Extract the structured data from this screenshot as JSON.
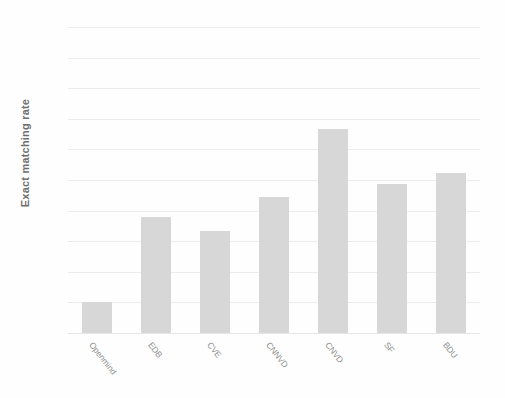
{
  "chart_data": {
    "type": "bar",
    "title": "",
    "subtitle": "",
    "xlabel": "",
    "ylabel": "Exact matching rate",
    "categories": [
      "Openmind",
      "EDB",
      "CVE",
      "CNNVD",
      "CNVD",
      "SF",
      "BDU"
    ],
    "values": [
      0.05,
      0.19,
      0.167,
      0.222,
      0.333,
      0.244,
      0.261
    ],
    "series": [
      {
        "name": "Exact matching rate",
        "values": [
          0.05,
          0.19,
          0.167,
          0.222,
          0.333,
          0.244,
          0.261
        ]
      }
    ],
    "ylim": [
      0,
      0.5
    ],
    "ytick_values": [
      0.5,
      0.45,
      0.4,
      0.35,
      0.3,
      0.25,
      0.2,
      0.15,
      0.1,
      0.05,
      0
    ],
    "ytick_labels": [
      "0.5",
      "0.45",
      "0.4",
      "0.35",
      "0.3",
      "0.25",
      "0.2",
      "0.15",
      "0.1",
      "0.05",
      "0"
    ],
    "ytick_step": 0.05,
    "grid": true,
    "grid_axis": "y",
    "legend": false,
    "legend_position": "none",
    "bar_color": "#d7d7d7",
    "grid_color": "#e9e9e9",
    "text_color": "#8a8a8a",
    "background_color": "#fefefe",
    "xtick_rotation_degrees": 52
  }
}
